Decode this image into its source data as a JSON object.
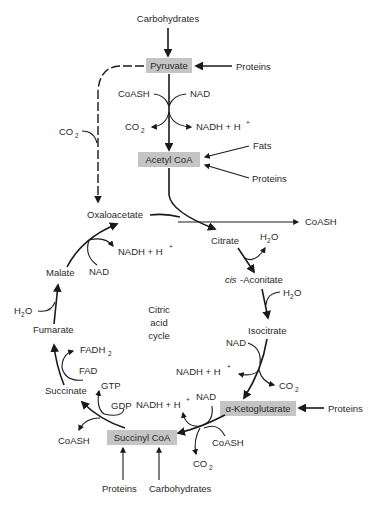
{
  "diagram": {
    "center_label": [
      "Citric",
      "acid",
      "cycle"
    ],
    "colors": {
      "box_fill": "#c4c4c4",
      "line": "#1a1a1a",
      "text": "#2a2a2a",
      "background": "#ffffff"
    },
    "nodes": {
      "carbohydrates_top": "Carbohydrates",
      "pyruvate": "Pyruvate",
      "proteins_pyruvate": "Proteins",
      "coash_in": "CoASH",
      "nad_pyruvate": "NAD",
      "co2_pyruvate": "CO",
      "co2_pyruvate_sub": "2",
      "nadh_pyruvate": "NADH + H",
      "nadh_pyruvate_sup": "+",
      "fats": "Fats",
      "acetyl_coa": "Acetyl CoA",
      "proteins_acetyl": "Proteins",
      "co2_dashed": "CO",
      "co2_dashed_sub": "2",
      "oxaloacetate": "Oxaloacetate",
      "coash_out": "CoASH",
      "citrate": "Citrate",
      "h2o_citrate": "H",
      "h2o_citrate_sub": "2",
      "h2o_citrate_o": "O",
      "cis_prefix": "cis",
      "aconitate": "-Aconitate",
      "h2o_aconitate": "H",
      "h2o_aconitate_sub": "2",
      "h2o_aconitate_o": "O",
      "isocitrate": "Isocitrate",
      "nad_isocitrate": "NAD",
      "nadh_isocitrate": "NADH + H",
      "nadh_isocitrate_sup": "+",
      "co2_isocitrate": "CO",
      "co2_isocitrate_sub": "2",
      "alpha_ketoglutarate": "α-Ketoglutarate",
      "proteins_akg": "Proteins",
      "nad_akg": "NAD",
      "nadh_akg": "NADH + H",
      "nadh_akg_sup": "+",
      "coash_akg": "CoASH",
      "co2_akg": "CO",
      "co2_akg_sub": "2",
      "succinyl_coa": "Succinyl CoA",
      "proteins_succinyl": "Proteins",
      "carbohydrates_succinyl": "Carbohydrates",
      "gdp": "GDP",
      "gtp": "GTP",
      "coash_succinate": "CoASH",
      "succinate": "Succinate",
      "fad": "FAD",
      "fadh2": "FADH",
      "fadh2_sub": "2",
      "fumarate": "Fumarate",
      "h2o_fumarate": "H",
      "h2o_fumarate_sub": "2",
      "h2o_fumarate_o": "O",
      "malate": "Malate",
      "nad_malate": "NAD",
      "nadh_malate": "NADH + H",
      "nadh_malate_sup": "+"
    }
  }
}
